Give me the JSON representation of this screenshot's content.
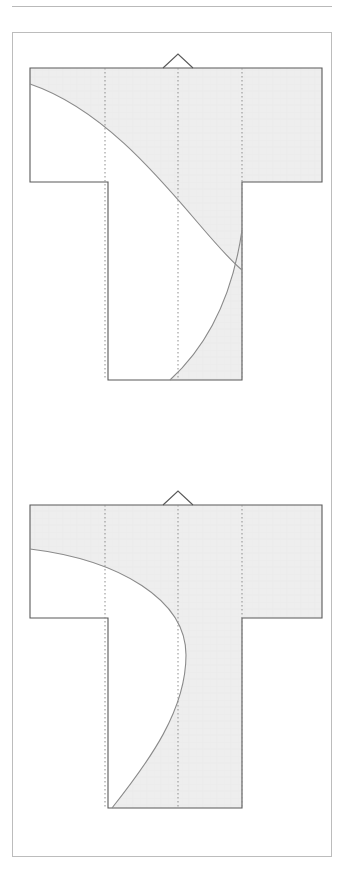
{
  "figure": {
    "kind": "technical-pattern-diagram",
    "title": "",
    "caption": "",
    "background_color": "#ffffff",
    "frame": {
      "x": 12,
      "y": 32,
      "width": 320,
      "height": 825,
      "stroke": "#bcbcbc",
      "stroke_width": 1
    },
    "top_rule": {
      "x": 12,
      "y": 6,
      "width": 320,
      "stroke": "#b9b9b9"
    },
    "style": {
      "outline_stroke": "#595959",
      "outline_stroke_width": 1.1,
      "curve_stroke": "#8a8a8a",
      "curve_stroke_width": 1.1,
      "fold_line_stroke": "#8d8d8d",
      "fold_line_dash": "1.5 2.5",
      "fill_color": "#eeeeee",
      "fill_stroke": "#e4e4e4"
    },
    "panels": [
      {
        "name": "upper-garment-pattern",
        "label": "",
        "geometry": {
          "shoulder_top_y": 68,
          "sleeve_left_x": 30,
          "sleeve_right_x": 322,
          "sleeve_hem_y": 182,
          "body_left_x": 108,
          "body_right_x": 242,
          "body_hem_y": 380,
          "center_x": 178,
          "neck_notch": {
            "left_x": 163,
            "apex_x": 178,
            "right_x": 193,
            "apex_y": 54
          },
          "fold_lines_x": [
            105,
            178,
            242
          ],
          "shaded_region": "right-upper-and-lower-right",
          "curve_type": "concave-sweep",
          "curve_start": {
            "x": 30,
            "y": 84
          },
          "curve_end": {
            "x": 242,
            "y": 270
          },
          "lower_curve_start": {
            "x": 242,
            "y": 230
          },
          "lower_curve_end": {
            "x": 170,
            "y": 380
          }
        }
      },
      {
        "name": "lower-garment-pattern",
        "label": "",
        "geometry": {
          "shoulder_top_y": 505,
          "sleeve_left_x": 30,
          "sleeve_right_x": 322,
          "sleeve_hem_y": 618,
          "body_left_x": 108,
          "body_right_x": 242,
          "body_hem_y": 808,
          "center_x": 178,
          "neck_notch": {
            "left_x": 163,
            "apex_x": 178,
            "right_x": 193,
            "apex_y": 491
          },
          "fold_lines_x": [
            105,
            178,
            242
          ],
          "shaded_region": "majority-filled-with-s-curve-cutout",
          "curve_type": "s-curve-bulge",
          "curve_start": {
            "x": 30,
            "y": 549
          },
          "curve_apex": {
            "x": 186,
            "y": 655
          },
          "curve_end": {
            "x": 112,
            "y": 808
          }
        }
      }
    ]
  }
}
